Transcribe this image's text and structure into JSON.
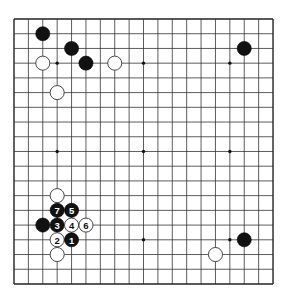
{
  "board": {
    "size": 19,
    "origin": {
      "x": 14,
      "y": 19
    },
    "spacing": {
      "x": 14.39,
      "y": 14.72
    },
    "colors": {
      "background": "#ffffff",
      "lines": "#333333",
      "black": "#111111",
      "white": "#ffffff"
    },
    "star_points": [
      {
        "col": 3,
        "row": 3
      },
      {
        "col": 9,
        "row": 3
      },
      {
        "col": 15,
        "row": 3
      },
      {
        "col": 3,
        "row": 9
      },
      {
        "col": 9,
        "row": 9
      },
      {
        "col": 15,
        "row": 9
      },
      {
        "col": 3,
        "row": 15
      },
      {
        "col": 9,
        "row": 15
      },
      {
        "col": 15,
        "row": 15
      }
    ],
    "stones": [
      {
        "color": "black",
        "col": 2,
        "row": 1,
        "label": ""
      },
      {
        "color": "black",
        "col": 4,
        "row": 2,
        "label": ""
      },
      {
        "color": "black",
        "col": 5,
        "row": 3,
        "label": ""
      },
      {
        "color": "white",
        "col": 2,
        "row": 3,
        "label": ""
      },
      {
        "color": "white",
        "col": 7,
        "row": 3,
        "label": ""
      },
      {
        "color": "white",
        "col": 3,
        "row": 5,
        "label": ""
      },
      {
        "color": "black",
        "col": 16,
        "row": 2,
        "label": ""
      },
      {
        "color": "black",
        "col": 16,
        "row": 15,
        "label": ""
      },
      {
        "color": "white",
        "col": 14,
        "row": 16,
        "label": ""
      },
      {
        "color": "white",
        "col": 3,
        "row": 12,
        "label": ""
      },
      {
        "color": "black",
        "col": 3,
        "row": 13,
        "label": "7"
      },
      {
        "color": "black",
        "col": 4,
        "row": 13,
        "label": "5"
      },
      {
        "color": "black",
        "col": 2,
        "row": 14,
        "label": ""
      },
      {
        "color": "black",
        "col": 3,
        "row": 14,
        "label": "3"
      },
      {
        "color": "white",
        "col": 4,
        "row": 14,
        "label": "4"
      },
      {
        "color": "white",
        "col": 5,
        "row": 14,
        "label": "6"
      },
      {
        "color": "white",
        "col": 3,
        "row": 15,
        "label": "2"
      },
      {
        "color": "black",
        "col": 4,
        "row": 15,
        "label": "1"
      },
      {
        "color": "white",
        "col": 3,
        "row": 16,
        "label": ""
      }
    ]
  }
}
